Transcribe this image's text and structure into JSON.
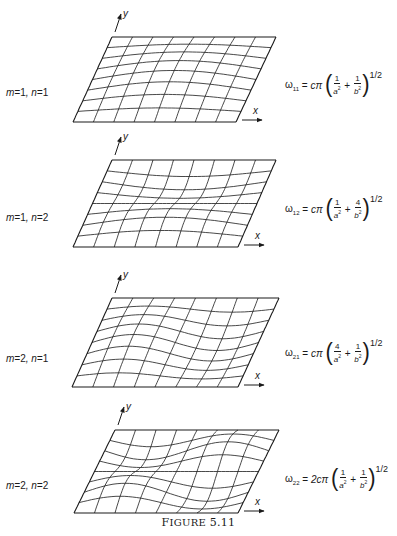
{
  "figure": {
    "caption_first": "F",
    "caption_rest": "IGURE",
    "caption_number": "5.11",
    "stroke_color": "#1a1a1a",
    "background_color": "#ffffff"
  },
  "axes": {
    "x_label": "x",
    "y_label": "y"
  },
  "panels": [
    {
      "mode_m": "1",
      "mode_n": "1",
      "label": "m=1, n=1",
      "formula": {
        "omega_sub": "11",
        "prefix": "cπ",
        "term1_num": "1",
        "term1_den": "a",
        "term2_num": "1",
        "term2_den": "b",
        "exponent": "1/2"
      },
      "geometry": {
        "top_y": 37,
        "bottom_y": 122,
        "top_left_x": 112,
        "top_right_x": 276,
        "bottom_left_x": 73,
        "bottom_right_x": 236
      },
      "mesh": {
        "m": 1,
        "n": 1,
        "amp": 9
      }
    },
    {
      "mode_m": "1",
      "mode_n": "2",
      "label": "m=1, n=2",
      "formula": {
        "omega_sub": "12",
        "prefix": "cπ",
        "term1_num": "1",
        "term1_den": "a",
        "term2_num": "4",
        "term2_den": "b",
        "exponent": "1/2"
      },
      "geometry": {
        "top_y": 160,
        "bottom_y": 247,
        "top_left_x": 112,
        "top_right_x": 276,
        "bottom_left_x": 73,
        "bottom_right_x": 238
      },
      "mesh": {
        "m": 1,
        "n": 2,
        "amp": 8
      }
    },
    {
      "mode_m": "2",
      "mode_n": "1",
      "label": "m=2, n=1",
      "formula": {
        "omega_sub": "21",
        "prefix": "cπ",
        "term1_num": "4",
        "term1_den": "a",
        "term2_num": "1",
        "term2_den": "b",
        "exponent": "1/2"
      },
      "geometry": {
        "top_y": 298,
        "bottom_y": 387,
        "top_left_x": 112,
        "top_right_x": 279,
        "bottom_left_x": 72,
        "bottom_right_x": 238
      },
      "mesh": {
        "m": 2,
        "n": 1,
        "amp": 8
      }
    },
    {
      "mode_m": "2",
      "mode_n": "2",
      "label": "m=2, n=2",
      "formula": {
        "omega_sub": "22",
        "prefix": "2cπ",
        "term1_num": "1",
        "term1_den": "a",
        "term2_num": "1",
        "term2_den": "b",
        "exponent": "1/2"
      },
      "geometry": {
        "top_y": 430,
        "bottom_y": 513,
        "top_left_x": 115,
        "top_right_x": 279,
        "bottom_left_x": 74,
        "bottom_right_x": 238
      },
      "mesh": {
        "m": 2,
        "n": 2,
        "amp": 9
      }
    }
  ],
  "label_positions_y": [
    93,
    218,
    358,
    485
  ],
  "formula_positions_y": [
    80,
    204,
    348,
    474
  ]
}
